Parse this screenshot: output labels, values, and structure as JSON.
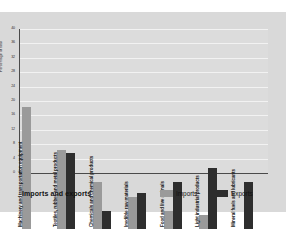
{
  "caption": "Imports and exports",
  "legend": {
    "items": [
      {
        "label": "Imports",
        "color": "#9a9a9a"
      },
      {
        "label": "Exports",
        "color": "#2e2e2e"
      }
    ]
  },
  "chart_data": {
    "type": "bar",
    "title": "Imports and exports",
    "xlabel": "",
    "ylabel": "Percentage of total",
    "ylim": [
      0,
      40
    ],
    "yticks": [
      0,
      4,
      8,
      12,
      16,
      20,
      24,
      28,
      32,
      36,
      40
    ],
    "grid": true,
    "legend_position": "bottom-right",
    "categories": [
      "Machinery and transportation equipment",
      "Textiles, rubber, and metal products",
      "Chemicals and chemical products",
      "Inedible raw materials",
      "Food and live animals",
      "Light industrial products",
      "Mineral fuels and lubricants"
    ],
    "series": [
      {
        "name": "Imports",
        "color": "#9a9a9a",
        "values": [
          34,
          22,
          13,
          9,
          5,
          4,
          0
        ]
      },
      {
        "name": "Exports",
        "color": "#2e2e2e",
        "values": [
          0,
          21,
          5,
          10,
          13,
          17,
          13
        ]
      }
    ]
  }
}
